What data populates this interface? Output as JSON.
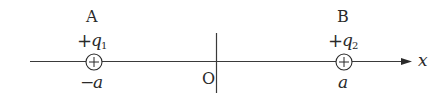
{
  "diagram": {
    "axis": {
      "label": "x",
      "origin_label": "O",
      "color": "#3a3a3a"
    },
    "charges": [
      {
        "point_label": "A",
        "charge_sign": "+",
        "charge_symbol": "q",
        "charge_subscript": "1",
        "position_label": "−a",
        "symbol": "⊕"
      },
      {
        "point_label": "B",
        "charge_sign": "+",
        "charge_symbol": "q",
        "charge_subscript": "2",
        "position_label": "a",
        "symbol": "⊕"
      }
    ]
  }
}
